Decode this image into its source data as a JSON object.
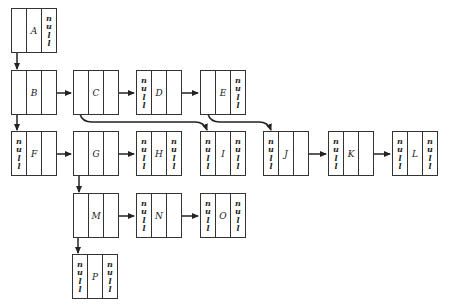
{
  "diagram": {
    "title": "",
    "null_text": "null",
    "nodes": [
      {
        "id": "A",
        "label": "A",
        "x": 11,
        "y": 8,
        "left": "",
        "right": "null"
      },
      {
        "id": "B",
        "label": "B",
        "x": 11,
        "y": 70,
        "left": "",
        "right": ""
      },
      {
        "id": "C",
        "label": "C",
        "x": 73,
        "y": 70,
        "left": "",
        "right": ""
      },
      {
        "id": "D",
        "label": "D",
        "x": 136,
        "y": 70,
        "left": "null",
        "right": ""
      },
      {
        "id": "E",
        "label": "E",
        "x": 200,
        "y": 70,
        "left": "",
        "right": "null"
      },
      {
        "id": "F",
        "label": "F",
        "x": 11,
        "y": 131,
        "left": "null",
        "right": ""
      },
      {
        "id": "G",
        "label": "G",
        "x": 73,
        "y": 131,
        "left": "",
        "right": ""
      },
      {
        "id": "H",
        "label": "H",
        "x": 136,
        "y": 131,
        "left": "null",
        "right": "null"
      },
      {
        "id": "I",
        "label": "I",
        "x": 200,
        "y": 131,
        "left": "null",
        "right": "null"
      },
      {
        "id": "J",
        "label": "J",
        "x": 263,
        "y": 131,
        "left": "null",
        "right": ""
      },
      {
        "id": "K",
        "label": "K",
        "x": 328,
        "y": 131,
        "left": "null",
        "right": ""
      },
      {
        "id": "L",
        "label": "L",
        "x": 392,
        "y": 131,
        "left": "null",
        "right": "null"
      },
      {
        "id": "M",
        "label": "M",
        "x": 73,
        "y": 193,
        "left": "",
        "right": ""
      },
      {
        "id": "N",
        "label": "N",
        "x": 136,
        "y": 193,
        "left": "null",
        "right": ""
      },
      {
        "id": "O",
        "label": "O",
        "x": 200,
        "y": 193,
        "left": "null",
        "right": "null"
      },
      {
        "id": "P",
        "label": "P",
        "x": 72,
        "y": 254,
        "left": "null",
        "right": "null"
      }
    ],
    "edges": [
      {
        "from": "A",
        "to": "B",
        "kind": "child"
      },
      {
        "from": "B",
        "to": "C",
        "kind": "sibling"
      },
      {
        "from": "C",
        "to": "D",
        "kind": "sibling"
      },
      {
        "from": "D",
        "to": "E",
        "kind": "sibling"
      },
      {
        "from": "B",
        "to": "F",
        "kind": "child"
      },
      {
        "from": "C",
        "to": "I",
        "kind": "child-curved"
      },
      {
        "from": "E",
        "to": "J",
        "kind": "child-curved"
      },
      {
        "from": "F",
        "to": "G",
        "kind": "sibling"
      },
      {
        "from": "G",
        "to": "H",
        "kind": "sibling"
      },
      {
        "from": "J",
        "to": "K",
        "kind": "sibling"
      },
      {
        "from": "K",
        "to": "L",
        "kind": "sibling"
      },
      {
        "from": "G",
        "to": "M",
        "kind": "child"
      },
      {
        "from": "M",
        "to": "N",
        "kind": "sibling"
      },
      {
        "from": "N",
        "to": "O",
        "kind": "sibling"
      },
      {
        "from": "M",
        "to": "P",
        "kind": "child"
      }
    ]
  }
}
